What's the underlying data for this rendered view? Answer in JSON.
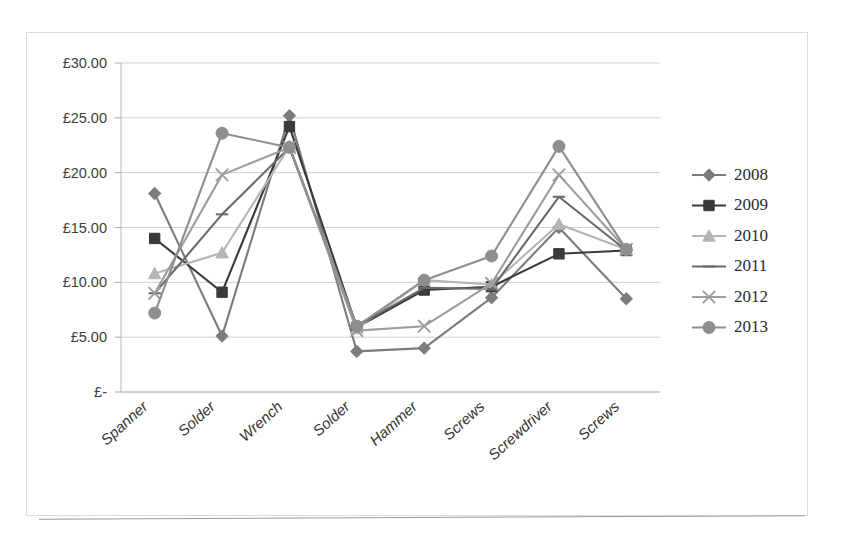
{
  "chart_data": {
    "type": "line",
    "title": "",
    "xlabel": "",
    "ylabel": "",
    "categories": [
      "Spanner",
      "Solder",
      "Wrench",
      "Solder",
      "Hammer",
      "Screws",
      "Screwdriver",
      "Screws"
    ],
    "ytick_labels": [
      "£30.00",
      "£25.00",
      "£20.00",
      "£15.00",
      "£10.00",
      "£5.00",
      "£-"
    ],
    "ytick_values": [
      30,
      25,
      20,
      15,
      10,
      5,
      0
    ],
    "ylim": [
      0,
      30
    ],
    "grid": true,
    "legend_position": "right",
    "currency_symbol": "£",
    "series": [
      {
        "name": "2008",
        "marker": "diamond",
        "color": "#7b7b7b",
        "values": [
          18.1,
          5.1,
          25.2,
          3.7,
          4.0,
          8.6,
          15.0,
          8.5
        ]
      },
      {
        "name": "2009",
        "marker": "square",
        "color": "#3a3a3a",
        "values": [
          14.0,
          9.1,
          24.2,
          5.9,
          9.3,
          9.6,
          12.6,
          12.9
        ]
      },
      {
        "name": "2010",
        "marker": "triangle",
        "color": "#b5b5b5",
        "values": [
          10.8,
          12.7,
          22.4,
          5.8,
          10.2,
          9.8,
          15.3,
          13.0
        ]
      },
      {
        "name": "2011",
        "marker": "line",
        "color": "#6a6a6a",
        "values": [
          9.0,
          16.2,
          22.3,
          6.0,
          9.5,
          9.4,
          17.8,
          12.9
        ]
      },
      {
        "name": "2012",
        "marker": "cross",
        "color": "#9d9d9d",
        "values": [
          9.0,
          19.8,
          22.3,
          5.6,
          6.0,
          9.9,
          19.8,
          13.0
        ]
      },
      {
        "name": "2013",
        "marker": "circle",
        "color": "#8e8e8e",
        "values": [
          7.2,
          23.6,
          22.3,
          6.0,
          10.2,
          12.4,
          22.4,
          13.0
        ]
      }
    ]
  },
  "legend": {
    "entries": [
      "2008",
      "2009",
      "2010",
      "2011",
      "2012",
      "2013"
    ]
  }
}
